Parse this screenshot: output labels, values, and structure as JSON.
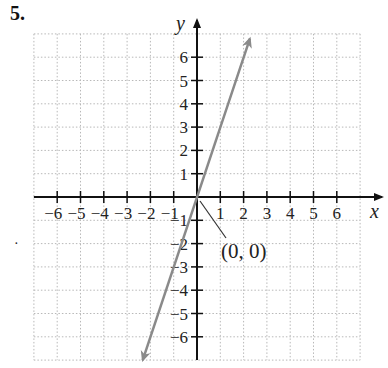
{
  "problem_number": "5.",
  "bullet": "·",
  "chart_data": {
    "type": "line",
    "title": "",
    "xlabel": "x",
    "ylabel": "y",
    "xlim": [
      -7,
      7
    ],
    "ylim": [
      -7,
      7
    ],
    "grid": true,
    "x_ticks": [
      -6,
      -5,
      -4,
      -3,
      -2,
      -1,
      1,
      2,
      3,
      4,
      5,
      6
    ],
    "y_ticks": [
      -6,
      -5,
      -4,
      -3,
      -2,
      -1,
      1,
      2,
      3,
      4,
      5,
      6
    ],
    "x_tick_labels": [
      "−6",
      "−5",
      "−4",
      "−3",
      "−2",
      "−1",
      "1",
      "2",
      "3",
      "4",
      "5",
      "6"
    ],
    "y_tick_labels": [
      "6",
      "5",
      "4",
      "3",
      "2",
      "1",
      "−1",
      "−2",
      "−3",
      "−4",
      "−5",
      "−6"
    ],
    "series": [
      {
        "name": "y = 3x",
        "x": [
          -2.33,
          0,
          2.27
        ],
        "y": [
          -7,
          0,
          6.8
        ],
        "color": "#8a8a8a",
        "arrows": "both"
      }
    ],
    "annotations": [
      {
        "text": "(0, 0)",
        "point": [
          0,
          0
        ]
      }
    ]
  }
}
